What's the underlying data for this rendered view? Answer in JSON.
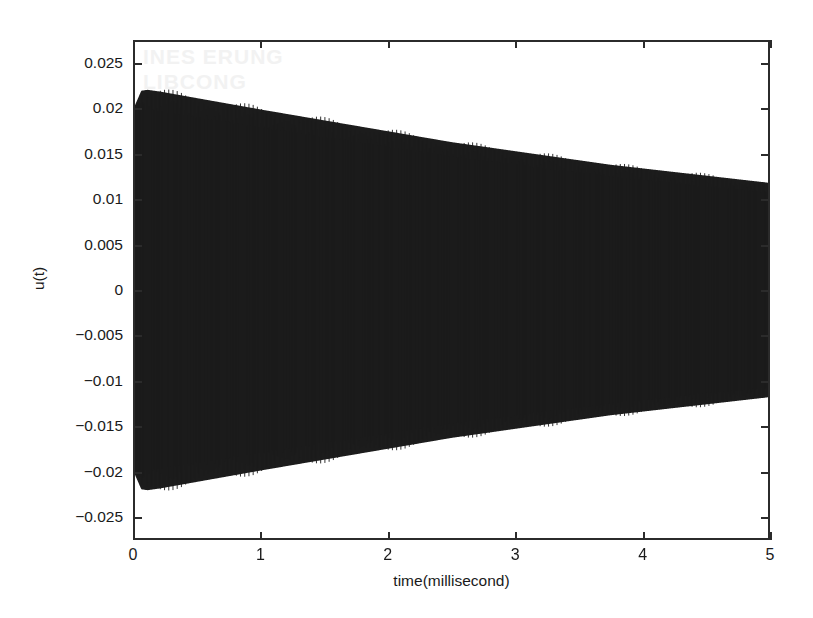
{
  "figure": {
    "background_color": "#ffffff",
    "axis_color": "#2b2b2b",
    "trace_color": "#1c1c1c",
    "watermark_text": "INES ERUNG\nLIBCONG"
  },
  "axes": {
    "x_title": "time(millisecond)",
    "y_title": "u(t)",
    "x_ticks": [
      "0",
      "1",
      "2",
      "3",
      "4",
      "5"
    ],
    "y_ticks": [
      "0.025",
      "0.02",
      "0.015",
      "0.01",
      "0.005",
      "0",
      "-0.005",
      "-0.01",
      "-0.015",
      "-0.02",
      "-0.025"
    ]
  },
  "chart_data": {
    "type": "line",
    "title": "",
    "subtitle": "",
    "xlabel": "time(millisecond)",
    "ylabel": "u(t)",
    "xlim": [
      0,
      5
    ],
    "ylim": [
      -0.0275,
      0.0275
    ],
    "x_tick_values": [
      0,
      1,
      2,
      3,
      4,
      5
    ],
    "y_tick_values": [
      0.025,
      0.02,
      0.015,
      0.01,
      0.005,
      0,
      -0.005,
      -0.01,
      -0.015,
      -0.02,
      -0.025
    ],
    "grid": false,
    "legend": null,
    "legend_position": "none",
    "annotations": [],
    "series": [
      {
        "name": "u(t)",
        "color": "#1c1c1c",
        "carrier_frequency_khz": 120,
        "envelope_model": "rise-then-exponential-decay",
        "envelope_upper": {
          "x": [
            0.0,
            0.05,
            0.1,
            0.2,
            0.4,
            0.6,
            0.8,
            1.0,
            1.25,
            1.5,
            1.75,
            2.0,
            2.25,
            2.5,
            2.75,
            3.0,
            3.25,
            3.5,
            3.75,
            4.0,
            4.25,
            4.5,
            4.75,
            5.0
          ],
          "y": [
            0.0205,
            0.0221,
            0.0222,
            0.022,
            0.0215,
            0.021,
            0.0205,
            0.02,
            0.0194,
            0.0188,
            0.0182,
            0.0176,
            0.017,
            0.0164,
            0.0159,
            0.0154,
            0.0149,
            0.0144,
            0.0139,
            0.0135,
            0.0131,
            0.0127,
            0.0123,
            0.0119
          ]
        },
        "envelope_lower": {
          "x": [
            0.0,
            0.05,
            0.1,
            0.2,
            0.4,
            0.6,
            0.8,
            1.0,
            1.25,
            1.5,
            1.75,
            2.0,
            2.25,
            2.5,
            2.75,
            3.0,
            3.25,
            3.5,
            3.75,
            4.0,
            4.25,
            4.5,
            4.75,
            5.0
          ],
          "y": [
            -0.0205,
            -0.0221,
            -0.0222,
            -0.022,
            -0.0215,
            -0.021,
            -0.0205,
            -0.02,
            -0.0194,
            -0.0188,
            -0.0182,
            -0.0176,
            -0.017,
            -0.0164,
            -0.0159,
            -0.0154,
            -0.0149,
            -0.0144,
            -0.0139,
            -0.0135,
            -0.0131,
            -0.0127,
            -0.0123,
            -0.0119
          ]
        }
      }
    ]
  }
}
